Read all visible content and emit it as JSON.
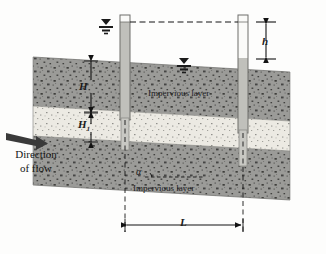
{
  "figure": {
    "labels": {
      "impervious_upper": "Impervious layer",
      "impervious_lower": "Impervious layer",
      "direction_line1": "Direction",
      "direction_line2": "of flow",
      "dim_H": "H",
      "dim_H1_letter": "H",
      "dim_H1_sub": "1",
      "dim_h": "h",
      "dim_L": "L",
      "angle_alpha": "α"
    },
    "icons": {
      "water_table_left": "water-table-icon",
      "water_table_right": "water-table-icon",
      "flow_arrow": "flow-arrow-icon"
    },
    "colors": {
      "impervious_fill": "#9a9a97",
      "aquifer_fill": "#ece9e2",
      "standpipe_water": "#bdbdb8",
      "standpipe_outline": "#6f6f6c",
      "line": "#151515",
      "background": "#fdfdfc"
    },
    "geometry": {
      "standpipe_left_x": 125,
      "standpipe_right_x": 243,
      "dim_L_value_label": "L"
    }
  }
}
